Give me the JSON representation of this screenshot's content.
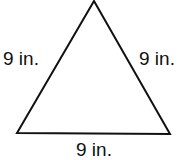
{
  "diagram": {
    "type": "equilateral-triangle",
    "stroke_color": "#111111",
    "background": "#ffffff",
    "vertices": {
      "apex": [
        94,
        1
      ],
      "bottom_left": [
        17,
        133
      ],
      "bottom_right": [
        170,
        134
      ]
    },
    "labels": {
      "left_side": "9 in.",
      "right_side": "9 in.",
      "bottom_side": "9 in."
    }
  }
}
